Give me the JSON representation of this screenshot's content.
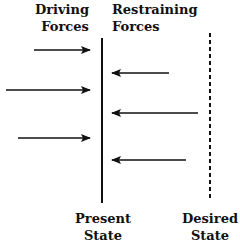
{
  "diagram": {
    "labels": {
      "driving": [
        "Driving",
        "Forces"
      ],
      "restraining": [
        "Restraining",
        "Forces"
      ],
      "present": [
        "Present",
        "State"
      ],
      "desired": [
        "Desired",
        "State"
      ]
    },
    "present_state_line": {
      "x": 102,
      "y1": 38,
      "y2": 203,
      "style": "solid"
    },
    "desired_state_line": {
      "x": 210,
      "y1": 33,
      "y2": 200,
      "style": "dashed"
    },
    "driving_forces": [
      {
        "y": 50,
        "x_start": 34,
        "x_end": 90
      },
      {
        "y": 90,
        "x_start": 6,
        "x_end": 90
      },
      {
        "y": 138,
        "x_start": 18,
        "x_end": 90
      }
    ],
    "restraining_forces": [
      {
        "y": 73,
        "x_start": 169,
        "x_end": 112
      },
      {
        "y": 113,
        "x_start": 198,
        "x_end": 112
      },
      {
        "y": 160,
        "x_start": 186,
        "x_end": 112
      }
    ],
    "colors": {
      "ink": "#111111",
      "background": "#ffffff"
    }
  }
}
